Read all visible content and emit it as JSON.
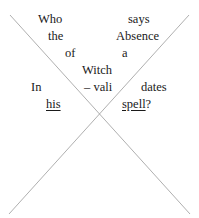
{
  "artwork": {
    "type": "concrete-poem",
    "background_color": "#ffffff",
    "text_color": "#1a1a1a",
    "line_color": "#9a9a9a",
    "full_text": "Who says the Absence of a Witch In – vali dates his spell?"
  },
  "lines": [
    {
      "id": "line-1",
      "words": [
        {
          "text": "Who",
          "x": 38,
          "underlined": false
        },
        {
          "text": "says",
          "x": 128,
          "underlined": false
        }
      ]
    },
    {
      "id": "line-2",
      "words": [
        {
          "text": "the",
          "x": 48,
          "underlined": false
        },
        {
          "text": "Absence",
          "x": 116,
          "underlined": false
        }
      ]
    },
    {
      "id": "line-3",
      "words": [
        {
          "text": "of",
          "x": 65,
          "underlined": false
        },
        {
          "text": "a",
          "x": 122,
          "underlined": false
        }
      ]
    },
    {
      "id": "line-4",
      "words": [
        {
          "text": "Witch",
          "x": 82,
          "underlined": false
        }
      ]
    },
    {
      "id": "line-5",
      "words": [
        {
          "text": "In",
          "x": 31,
          "underlined": false
        },
        {
          "text": "– vali",
          "x": 84,
          "underlined": false
        },
        {
          "text": "dates",
          "x": 141,
          "underlined": false
        }
      ]
    },
    {
      "id": "line-6",
      "words": [
        {
          "text": "his",
          "x": 46,
          "underlined": true
        },
        {
          "text": "spell",
          "x": 122,
          "underlined": true,
          "tail": "?"
        }
      ]
    }
  ],
  "cross": {
    "stroke_color": "#9a9a9a",
    "stroke_width": 0.8,
    "diagonal_top_left_to_bottom_right": {
      "x1": 10,
      "y1": 15,
      "x2": 190,
      "y2": 214
    },
    "diagonal_top_right_to_bottom_left": {
      "x1": 189,
      "y1": 15,
      "x2": 9,
      "y2": 214
    },
    "intersection": {
      "x": 99,
      "y": 118
    }
  }
}
